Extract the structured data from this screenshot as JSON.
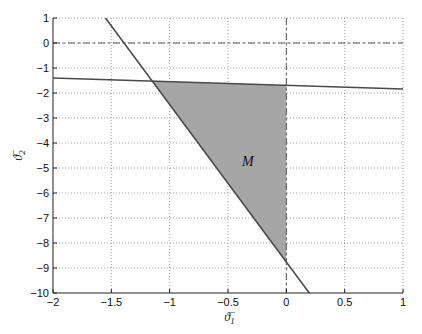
{
  "chart_data": {
    "type": "area",
    "title": "",
    "xlabel": "ϑ₁⁻",
    "ylabel": "ϑ₂⁻",
    "xlim": [
      -2,
      1
    ],
    "ylim": [
      -10,
      1
    ],
    "grid": true,
    "x_ticks": [
      -2,
      -1.5,
      -1,
      -0.5,
      0,
      0.5,
      1
    ],
    "x_tick_labels": [
      "−2",
      "−1.5",
      "−1",
      "−0.5",
      "0",
      "0.5",
      "1"
    ],
    "y_ticks": [
      1,
      0,
      -1,
      -2,
      -3,
      -4,
      -5,
      -6,
      -7,
      -8,
      -9,
      -10
    ],
    "y_tick_labels": [
      "1",
      "0",
      "−1",
      "−2",
      "−3",
      "−4",
      "−5",
      "−6",
      "−7",
      "−8",
      "−9",
      "−10"
    ],
    "series": [
      {
        "name": "steep boundary line",
        "style": "solid",
        "points": [
          [
            -1.55,
            1
          ],
          [
            0.2,
            -10.02
          ]
        ]
      },
      {
        "name": "shallow boundary line",
        "style": "solid",
        "points": [
          [
            -2,
            -1.4
          ],
          [
            1,
            -1.84
          ]
        ]
      },
      {
        "name": "theta2 = 0 reference",
        "style": "dash-dot",
        "points": [
          [
            -2,
            0
          ],
          [
            1,
            0
          ]
        ]
      },
      {
        "name": "theta1 = 0 reference",
        "style": "dash-dot",
        "points": [
          [
            0,
            1
          ],
          [
            0,
            -10
          ]
        ]
      }
    ],
    "regions": [
      {
        "name": "M",
        "fill": "#a6a6a6",
        "vertices": [
          [
            -1.149,
            -1.524
          ],
          [
            0,
            -1.693
          ],
          [
            0,
            -8.76
          ]
        ]
      }
    ],
    "annotations": [
      {
        "text": "M",
        "x": -0.33,
        "y": -4.7
      }
    ]
  },
  "labels": {
    "xlabel_base": "ϑ",
    "xlabel_sub": "1",
    "xlabel_sup": "−",
    "ylabel_base": "ϑ",
    "ylabel_sub": "2",
    "ylabel_sup": "−",
    "region": "M"
  },
  "colors": {
    "line": "#4a4a4a",
    "region_fill": "#a6a6a6",
    "grid": "#8a8a8a",
    "axis": "#222222"
  }
}
